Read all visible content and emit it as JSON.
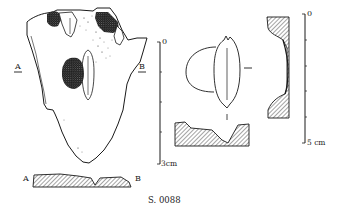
{
  "figure": {
    "caption": "S. 0088",
    "views": {
      "front_view": {
        "section_marker_left": "A",
        "section_marker_right": "B"
      },
      "cross_section_ab": {
        "label_left": "A",
        "label_right": "B"
      },
      "side_view": {},
      "detail_view": {},
      "profile_section": {}
    },
    "scale_bars": {
      "left": {
        "top_label": "0",
        "bottom_label": "3cm",
        "ticks": 5
      },
      "right": {
        "top_label": "0",
        "bottom_label": "5 cm",
        "ticks": 6
      }
    },
    "colors": {
      "ink": "#1a1a1a",
      "background": "#ffffff",
      "stipple": "#222222"
    }
  }
}
